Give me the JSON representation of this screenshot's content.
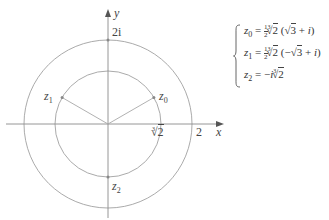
{
  "figure": {
    "axes": {
      "x_label": "x",
      "y_label": "y",
      "origin_px": [
        108,
        124
      ],
      "unit_px": 42
    },
    "circles": [
      {
        "name": "outer",
        "radius_value": 2,
        "radius_px": 84,
        "color": "#999999"
      },
      {
        "name": "inner",
        "radius_value": "∛2",
        "radius_px": 53,
        "color": "#999999"
      }
    ],
    "tick_labels": {
      "x_outer": "2",
      "x_inner_index": "3",
      "x_inner_radicand": "2",
      "y_outer": "2i"
    },
    "points": [
      {
        "name": "z",
        "sub": "0",
        "angle_deg": 30
      },
      {
        "name": "z",
        "sub": "1",
        "angle_deg": 150
      },
      {
        "name": "z",
        "sub": "2",
        "angle_deg": 270
      }
    ],
    "colors": {
      "axis": "#8a8a8a",
      "circle": "#a0a0a0",
      "ray": "#a8a8a8",
      "point": "#888888",
      "text": "#333333"
    }
  },
  "equations": [
    {
      "lhs_var": "z",
      "lhs_sub": "0",
      "eq": "=",
      "coef_num": "1",
      "coef_den": "2",
      "root_index": "3",
      "root_radicand": "2",
      "paren_open": "(",
      "sign": "",
      "sqrt_radicand": "3",
      "plus": "+",
      "imag": "i",
      "paren_close": ")"
    },
    {
      "lhs_var": "z",
      "lhs_sub": "1",
      "eq": "=",
      "coef_num": "1",
      "coef_den": "2",
      "root_index": "3",
      "root_radicand": "2",
      "paren_open": "(",
      "sign": "−",
      "sqrt_radicand": "3",
      "plus": "+",
      "imag": "i",
      "paren_close": ")"
    },
    {
      "lhs_var": "z",
      "lhs_sub": "2",
      "eq": "=",
      "neg": "−",
      "imag": "i",
      "root_index": "3",
      "root_radicand": "2"
    }
  ]
}
